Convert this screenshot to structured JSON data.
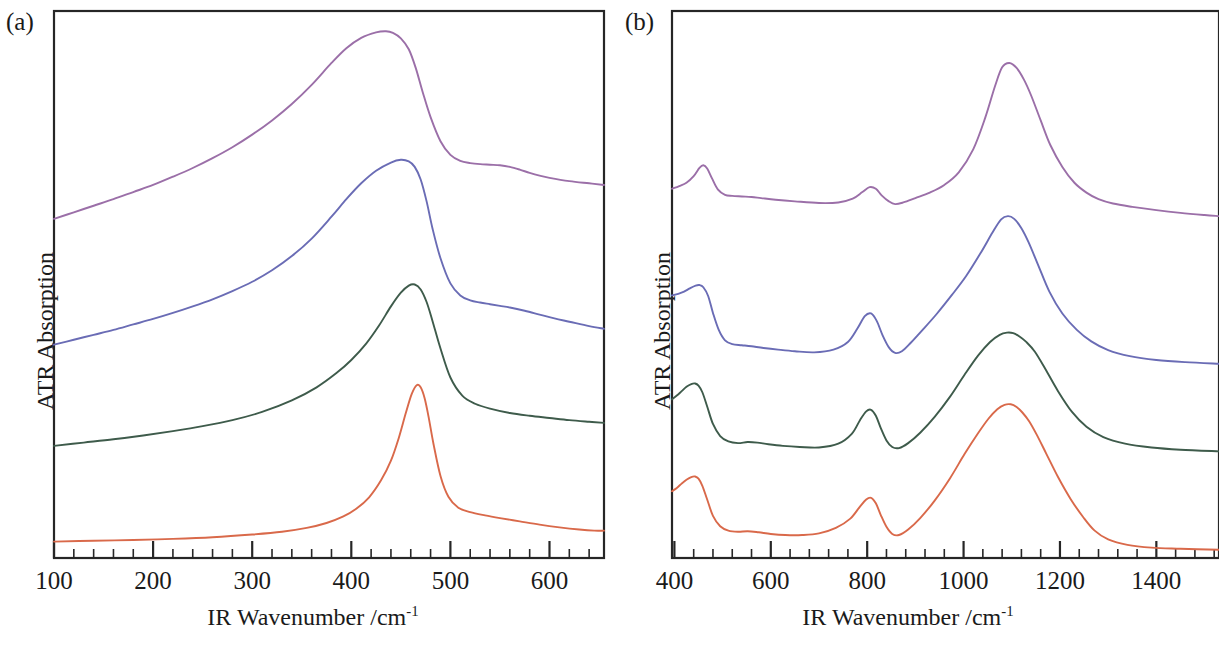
{
  "figure": {
    "background": "#ffffff"
  },
  "panels": [
    {
      "id": "a",
      "label": "(a)",
      "xlabel_main": "IR Wavenumber /cm",
      "xlabel_sup": "-1",
      "ylabel": "ATR Absorption"
    },
    {
      "id": "b",
      "label": "(b)",
      "xlabel_main": "IR Wavenumber /cm",
      "xlabel_sup": "-1",
      "ylabel": "ATR Absorption"
    }
  ],
  "colors": {
    "purple": "#9B6FA8",
    "blue": "#6A6CB5",
    "green": "#3E5B4B",
    "orange": "#D9694A",
    "frame": "#262626",
    "text": "#1a1a1a"
  },
  "chart_data": [
    {
      "type": "line",
      "panel": "a",
      "title": "(a)",
      "xlabel": "IR Wavenumber /cm-1",
      "ylabel": "ATR Absorption",
      "xlim": [
        100,
        655
      ],
      "ylim": [
        0,
        1
      ],
      "grid": false,
      "legend": "none",
      "xticks": [
        100,
        200,
        300,
        400,
        500,
        600
      ],
      "xtick_labels": [
        "100",
        "200",
        "300",
        "400",
        "500",
        "600"
      ],
      "xtick_minor_step": 20,
      "yticks": [],
      "ytick_labels": [],
      "axis_note": "y axis unlabelled, curves vertically offset",
      "series": [
        {
          "name": "purple",
          "color": "#9B6FA8",
          "offset": 0.62,
          "x": [
            100,
            120,
            140,
            160,
            180,
            200,
            220,
            240,
            260,
            280,
            300,
            320,
            340,
            360,
            380,
            395,
            410,
            425,
            435,
            442,
            450,
            458,
            465,
            472,
            480,
            490,
            500,
            510,
            520,
            530,
            540,
            550,
            560,
            570,
            580,
            590,
            600,
            620,
            640,
            655
          ],
          "values": [
            0.0,
            0.012,
            0.024,
            0.036,
            0.049,
            0.062,
            0.077,
            0.093,
            0.111,
            0.131,
            0.154,
            0.18,
            0.21,
            0.245,
            0.285,
            0.312,
            0.331,
            0.341,
            0.343,
            0.34,
            0.33,
            0.31,
            0.276,
            0.232,
            0.186,
            0.142,
            0.117,
            0.106,
            0.102,
            0.1,
            0.099,
            0.098,
            0.095,
            0.09,
            0.084,
            0.079,
            0.075,
            0.069,
            0.065,
            0.062
          ]
        },
        {
          "name": "blue",
          "color": "#6A6CB5",
          "offset": 0.39,
          "x": [
            100,
            120,
            140,
            160,
            180,
            200,
            220,
            240,
            260,
            280,
            300,
            320,
            340,
            360,
            380,
            395,
            410,
            425,
            440,
            450,
            458,
            464,
            470,
            476,
            482,
            490,
            500,
            510,
            520,
            530,
            540,
            550,
            560,
            575,
            590,
            605,
            620,
            640,
            655
          ],
          "values": [
            0.0,
            0.009,
            0.018,
            0.027,
            0.037,
            0.047,
            0.058,
            0.07,
            0.083,
            0.098,
            0.115,
            0.136,
            0.162,
            0.194,
            0.234,
            0.266,
            0.295,
            0.318,
            0.333,
            0.338,
            0.335,
            0.325,
            0.302,
            0.262,
            0.212,
            0.158,
            0.112,
            0.09,
            0.081,
            0.077,
            0.074,
            0.071,
            0.068,
            0.062,
            0.055,
            0.048,
            0.042,
            0.034,
            0.029
          ]
        },
        {
          "name": "green",
          "color": "#3E5B4B",
          "offset": 0.205,
          "x": [
            100,
            130,
            160,
            190,
            220,
            250,
            280,
            310,
            340,
            365,
            385,
            400,
            415,
            428,
            440,
            450,
            458,
            464,
            470,
            476,
            482,
            490,
            500,
            512,
            525,
            540,
            560,
            580,
            600,
            620,
            640,
            655
          ],
          "values": [
            0.0,
            0.006,
            0.012,
            0.019,
            0.027,
            0.036,
            0.047,
            0.062,
            0.083,
            0.107,
            0.133,
            0.157,
            0.187,
            0.22,
            0.255,
            0.28,
            0.293,
            0.295,
            0.286,
            0.263,
            0.228,
            0.178,
            0.125,
            0.092,
            0.077,
            0.068,
            0.06,
            0.055,
            0.051,
            0.047,
            0.044,
            0.042
          ]
        },
        {
          "name": "orange",
          "color": "#D9694A",
          "offset": 0.03,
          "x": [
            100,
            140,
            180,
            220,
            260,
            300,
            330,
            355,
            375,
            392,
            405,
            418,
            430,
            440,
            448,
            455,
            461,
            466,
            470,
            474,
            478,
            483,
            490,
            498,
            508,
            520,
            535,
            550,
            570,
            590,
            610,
            630,
            645,
            655
          ],
          "values": [
            0.0,
            0.0015,
            0.003,
            0.005,
            0.008,
            0.013,
            0.018,
            0.025,
            0.034,
            0.046,
            0.06,
            0.081,
            0.112,
            0.148,
            0.19,
            0.235,
            0.27,
            0.286,
            0.282,
            0.262,
            0.228,
            0.178,
            0.12,
            0.082,
            0.062,
            0.054,
            0.048,
            0.043,
            0.037,
            0.031,
            0.026,
            0.022,
            0.02,
            0.02
          ]
        }
      ]
    },
    {
      "type": "line",
      "panel": "b",
      "title": "(b)",
      "xlabel": "IR Wavenumber /cm-1",
      "ylabel": "ATR Absorption",
      "xlim": [
        395,
        1530
      ],
      "ylim": [
        0,
        1
      ],
      "grid": false,
      "legend": "none",
      "xticks": [
        400,
        600,
        800,
        1000,
        1200,
        1400
      ],
      "xtick_labels": [
        "400",
        "600",
        "800",
        "1000",
        "1200",
        "1400"
      ],
      "xtick_minor_step": 40,
      "yticks": [],
      "ytick_labels": [],
      "axis_note": "y axis unlabelled, curves vertically offset",
      "series": [
        {
          "name": "purple",
          "color": "#9B6FA8",
          "offset": 0.6,
          "x": [
            395,
            410,
            425,
            440,
            452,
            460,
            468,
            478,
            490,
            505,
            520,
            540,
            560,
            580,
            610,
            650,
            700,
            740,
            770,
            790,
            805,
            818,
            830,
            845,
            858,
            875,
            900,
            930,
            960,
            990,
            1020,
            1045,
            1065,
            1080,
            1095,
            1110,
            1125,
            1140,
            1160,
            1180,
            1205,
            1230,
            1255,
            1280,
            1310,
            1350,
            1400,
            1450,
            1500,
            1530
          ],
          "values": [
            0.075,
            0.08,
            0.086,
            0.098,
            0.113,
            0.118,
            0.112,
            0.094,
            0.074,
            0.064,
            0.062,
            0.061,
            0.06,
            0.058,
            0.055,
            0.052,
            0.049,
            0.05,
            0.057,
            0.069,
            0.078,
            0.075,
            0.063,
            0.052,
            0.047,
            0.05,
            0.058,
            0.068,
            0.082,
            0.105,
            0.147,
            0.205,
            0.262,
            0.297,
            0.305,
            0.296,
            0.275,
            0.246,
            0.2,
            0.155,
            0.115,
            0.086,
            0.068,
            0.056,
            0.048,
            0.042,
            0.036,
            0.031,
            0.027,
            0.025
          ]
        },
        {
          "name": "blue",
          "color": "#6A6CB5",
          "offset": 0.335,
          "x": [
            395,
            408,
            420,
            432,
            444,
            452,
            460,
            470,
            480,
            492,
            505,
            520,
            540,
            560,
            585,
            615,
            650,
            690,
            730,
            760,
            780,
            795,
            808,
            820,
            832,
            845,
            858,
            872,
            890,
            915,
            945,
            975,
            1005,
            1035,
            1060,
            1078,
            1092,
            1105,
            1120,
            1135,
            1155,
            1178,
            1205,
            1235,
            1265,
            1300,
            1345,
            1400,
            1460,
            1530
          ],
          "values": [
            0.145,
            0.148,
            0.152,
            0.158,
            0.163,
            0.164,
            0.16,
            0.144,
            0.113,
            0.082,
            0.063,
            0.056,
            0.054,
            0.052,
            0.049,
            0.046,
            0.043,
            0.041,
            0.046,
            0.06,
            0.085,
            0.107,
            0.112,
            0.098,
            0.072,
            0.05,
            0.04,
            0.043,
            0.058,
            0.082,
            0.112,
            0.145,
            0.18,
            0.222,
            0.26,
            0.284,
            0.29,
            0.285,
            0.268,
            0.242,
            0.2,
            0.152,
            0.112,
            0.082,
            0.061,
            0.045,
            0.034,
            0.027,
            0.023,
            0.02
          ]
        },
        {
          "name": "green",
          "color": "#3E5B4B",
          "offset": 0.155,
          "x": [
            395,
            405,
            415,
            425,
            435,
            443,
            450,
            458,
            468,
            480,
            495,
            512,
            532,
            552,
            572,
            595,
            625,
            660,
            700,
            740,
            768,
            785,
            798,
            808,
            818,
            828,
            840,
            852,
            866,
            885,
            910,
            940,
            972,
            1002,
            1030,
            1055,
            1075,
            1090,
            1103,
            1116,
            1130,
            1148,
            1170,
            1196,
            1225,
            1255,
            1290,
            1335,
            1390,
            1450,
            1530
          ],
          "values": [
            0.135,
            0.142,
            0.15,
            0.158,
            0.163,
            0.164,
            0.16,
            0.148,
            0.122,
            0.09,
            0.068,
            0.058,
            0.055,
            0.057,
            0.056,
            0.053,
            0.05,
            0.048,
            0.047,
            0.054,
            0.072,
            0.097,
            0.113,
            0.116,
            0.105,
            0.083,
            0.06,
            0.048,
            0.046,
            0.055,
            0.074,
            0.103,
            0.14,
            0.18,
            0.215,
            0.24,
            0.253,
            0.257,
            0.256,
            0.25,
            0.24,
            0.222,
            0.19,
            0.15,
            0.112,
            0.085,
            0.066,
            0.054,
            0.047,
            0.043,
            0.04
          ]
        },
        {
          "name": "orange",
          "color": "#D9694A",
          "offset": 0.0,
          "x": [
            395,
            405,
            415,
            425,
            435,
            443,
            450,
            458,
            468,
            480,
            495,
            512,
            532,
            552,
            575,
            600,
            630,
            665,
            700,
            735,
            765,
            785,
            798,
            808,
            818,
            828,
            840,
            852,
            866,
            885,
            910,
            940,
            972,
            1002,
            1030,
            1052,
            1070,
            1085,
            1098,
            1110,
            1122,
            1136,
            1152,
            1172,
            1196,
            1222,
            1248,
            1272,
            1300,
            1340,
            1390,
            1450,
            1530
          ],
          "values": [
            0.122,
            0.128,
            0.136,
            0.143,
            0.148,
            0.149,
            0.145,
            0.132,
            0.107,
            0.077,
            0.058,
            0.05,
            0.048,
            0.049,
            0.047,
            0.044,
            0.042,
            0.042,
            0.045,
            0.055,
            0.072,
            0.094,
            0.107,
            0.11,
            0.1,
            0.079,
            0.057,
            0.044,
            0.042,
            0.052,
            0.073,
            0.105,
            0.146,
            0.19,
            0.228,
            0.255,
            0.272,
            0.28,
            0.281,
            0.276,
            0.266,
            0.25,
            0.225,
            0.19,
            0.148,
            0.108,
            0.075,
            0.05,
            0.034,
            0.024,
            0.019,
            0.017,
            0.015
          ]
        }
      ]
    }
  ]
}
